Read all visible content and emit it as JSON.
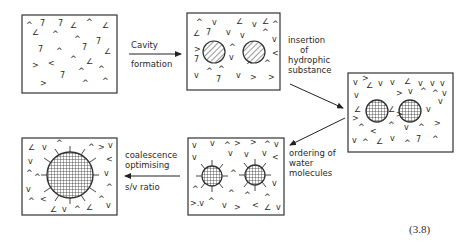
{
  "diagram": {
    "equation_number": "(3.8)",
    "stages": [
      {
        "id": "water",
        "description": "random water molecules"
      },
      {
        "id": "cavities",
        "description": "two hatched cavities in water"
      },
      {
        "id": "inserted",
        "description": "two cross-hatched hydrophobic spheres in water"
      },
      {
        "id": "ordered",
        "description": "two spheres with ordered water shell"
      },
      {
        "id": "coalesced",
        "description": "one large coalesced sphere with ordered water shell"
      }
    ],
    "arrows": [
      {
        "from": "water",
        "to": "cavities",
        "label_top": "Cavity",
        "label_bottom": "formation"
      },
      {
        "from": "cavities",
        "to": "inserted",
        "lines": [
          "insertion",
          "of",
          "hydrophic",
          "substance"
        ]
      },
      {
        "from": "inserted",
        "to": "ordered",
        "lines": [
          "ordering of",
          "water",
          "molecules"
        ]
      },
      {
        "from": "ordered",
        "to": "coalesced",
        "label_top_1": "coalescence",
        "label_top_2": "optimising",
        "label_bottom": "s/v ratio"
      }
    ]
  }
}
